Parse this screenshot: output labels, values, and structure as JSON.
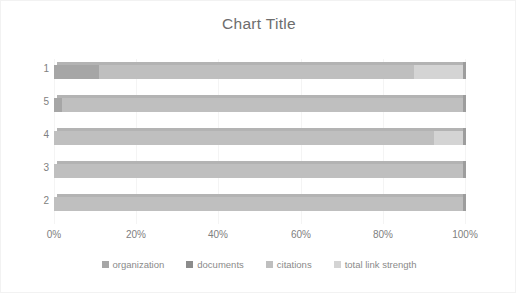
{
  "chart": {
    "title": "Chart Title",
    "background_color": "#ffffff",
    "border_color": "#f2f2f2",
    "text_color": "#808080",
    "title_color": "#6d6d6d"
  },
  "legend": {
    "position": "bottom",
    "items": [
      {
        "label": "organization",
        "color": "#a6a6a6"
      },
      {
        "label": "documents",
        "color": "#8c8c8c"
      },
      {
        "label": "citations",
        "color": "#bfbfbf"
      },
      {
        "label": "total link strength",
        "color": "#d4d4d4"
      }
    ]
  },
  "axes": {
    "x_ticks": [
      "0%",
      "20%",
      "40%",
      "60%",
      "80%",
      "100%"
    ],
    "x_tick_values": [
      0,
      20,
      40,
      60,
      80,
      100
    ],
    "y_categories": [
      "1",
      "5",
      "4",
      "3",
      "2"
    ]
  },
  "chart_data": {
    "type": "bar",
    "orientation": "horizontal",
    "stacked": "percent",
    "title": "Chart Title",
    "xlabel": "",
    "ylabel": "",
    "xlim": [
      0,
      100
    ],
    "grid": true,
    "legend_position": "bottom",
    "categories": [
      "1",
      "5",
      "4",
      "3",
      "2"
    ],
    "series": [
      {
        "name": "organization",
        "color": "#a6a6a6",
        "values": [
          11.0,
          2.0,
          0.0,
          0.0,
          0.0
        ]
      },
      {
        "name": "documents",
        "color": "#8c8c8c",
        "values": [
          0.0,
          0.0,
          0.0,
          0.0,
          0.0
        ]
      },
      {
        "name": "citations",
        "color": "#bfbfbf",
        "values": [
          77.0,
          98.0,
          93.0,
          100.0,
          100.0
        ]
      },
      {
        "name": "total link strength",
        "color": "#d4d4d4",
        "values": [
          12.0,
          0.0,
          7.0,
          0.0,
          0.0
        ]
      }
    ],
    "tick_labels": [
      "0%",
      "20%",
      "40%",
      "60%",
      "80%",
      "100%"
    ]
  }
}
